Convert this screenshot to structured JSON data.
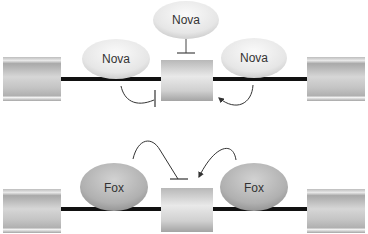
{
  "diagram": {
    "panels": [
      {
        "id": "top",
        "description": "Nova-mediated exon regulation",
        "proteins": [
          {
            "label": "Nova",
            "position": "above-middle-exon",
            "effect": "inhibits"
          },
          {
            "label": "Nova",
            "position": "upstream-intron",
            "effect": "inhibits"
          },
          {
            "label": "Nova",
            "position": "downstream-intron",
            "effect": "activates"
          }
        ]
      },
      {
        "id": "bottom",
        "description": "Fox-mediated exon regulation",
        "proteins": [
          {
            "label": "Fox",
            "position": "upstream-intron",
            "effect": "inhibits"
          },
          {
            "label": "Fox",
            "position": "downstream-intron",
            "effect": "activates"
          }
        ]
      }
    ],
    "labels": {
      "nova_top": "Nova",
      "nova_left": "Nova",
      "nova_right": "Nova",
      "fox_left": "Fox",
      "fox_right": "Fox"
    },
    "colors": {
      "line": "#111111",
      "exon_light": "#e6e6e6",
      "exon_dark": "#a8a8a8",
      "nova_fill": "#eeeeee",
      "fox_fill": "#b5b5b5",
      "arrow": "#333333"
    }
  }
}
